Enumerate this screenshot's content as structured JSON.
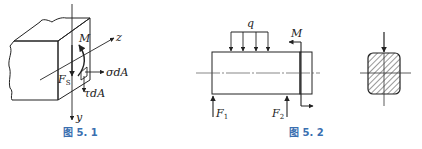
{
  "figures": [
    {
      "id": "fig1",
      "caption": "图 5. 1",
      "labels": {
        "moment": "M",
        "z_axis": "z",
        "y_axis": "y",
        "shear": "F",
        "shear_sub": "S",
        "normal_force": "σdA",
        "shear_stress": "τdA"
      }
    },
    {
      "id": "fig2",
      "caption": "图 5. 2",
      "labels": {
        "distributed_load": "q",
        "moment": "M",
        "force1": "F",
        "force1_sub": "1",
        "force2": "F",
        "force2_sub": "2"
      }
    },
    {
      "id": "fig3",
      "caption": "",
      "labels": {}
    }
  ],
  "colors": {
    "line": "#222222",
    "caption": "#3a6fb0"
  }
}
